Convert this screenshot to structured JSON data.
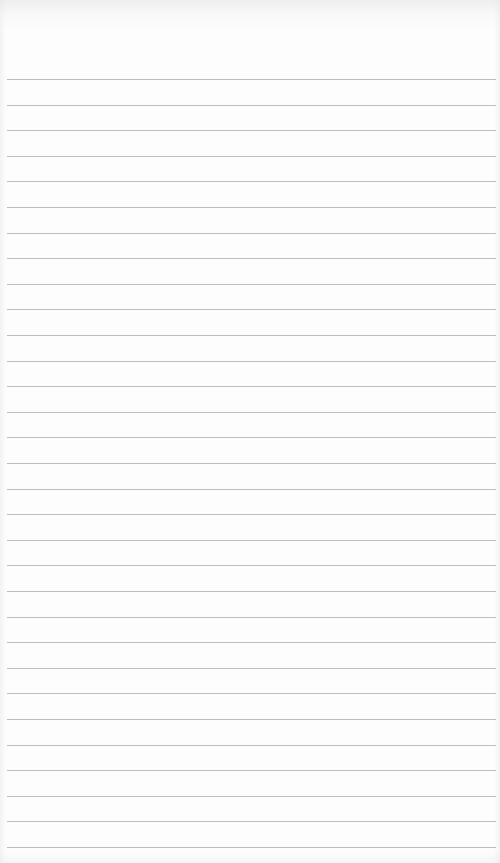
{
  "page": {
    "type": "lined-paper",
    "background_color": "#fdfdfd",
    "rule_color": "#bdbdbd",
    "rule_count": 31,
    "first_rule_y": 79,
    "rule_spacing": 25.6,
    "rule_left": 7,
    "rule_width": 489
  }
}
